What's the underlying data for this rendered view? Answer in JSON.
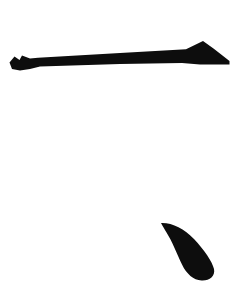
{
  "canvas": {
    "width": 243,
    "height": 287,
    "background_color": "#ffffff",
    "title": "Silhouette Shapes"
  },
  "palette": {
    "ink": "#0d0d0d",
    "background": "#ffffff"
  },
  "shapes": [
    {
      "id": "tapered-bar-with-arrowhead",
      "label": "Tapered horizontal bar with triangular arrowhead",
      "color": "#0d0d0d",
      "bounds": {
        "x": 8,
        "y": 40,
        "width": 222,
        "height": 34
      },
      "description": "Long slender bar sloping slightly upward from lower-left to right, with a forked notched tip at the left end and a solid triangular arrowhead peak at the right end",
      "path": "M 9.5 62.5 L 14.5 56.5 L 19.5 60.0 L 22.0 55.5 L 30.0 58.5 L 38.0 57.8 L 120.0 53.0 L 186.0 49.2 L 203.0 41.0 L 213.5 48.5 L 229.5 61.0 L 229.5 64.5 L 200.0 64.5 L 182.0 63.0 L 120.0 64.0 L 40.0 66.5 L 30.0 69.0 L 20.0 70.5 L 12.0 69.0 Z"
    },
    {
      "id": "curved-claw",
      "label": "Curved claw or comma shape",
      "color": "#0d0d0d",
      "bounds": {
        "x": 160,
        "y": 218,
        "width": 58,
        "height": 63
      },
      "description": "Crescent claw tapering from a fine point at the upper left, arcing down and to the right into a thick rounded bulb at the bottom",
      "path": "M 161.0 223.0 C 172.0 222.5 184.0 228.5 194.0 239.0 C 204.0 249.5 212.5 262.0 214.0 269.0 C 215.5 276.5 209.0 281.0 201.5 280.5 C 193.5 280.0 186.5 274.0 182.0 264.5 C 177.0 254.0 172.0 241.0 166.5 232.5 C 164.5 229.0 162.5 226.0 161.0 223.0 Z"
    }
  ]
}
